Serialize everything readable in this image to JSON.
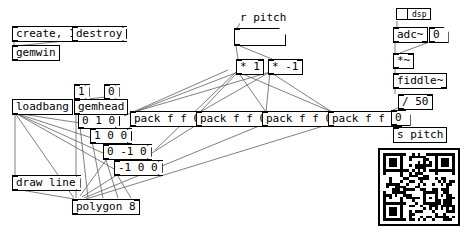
{
  "app": {
    "title": "Pure Data patch canvas",
    "background_color": "#ffffff",
    "wire_color": "#606060",
    "text_color": "#000000"
  },
  "patch": {
    "messages": [
      {
        "id": "msg-create",
        "label": "create, 1",
        "x": 12,
        "y": 26
      },
      {
        "id": "msg-destroy",
        "label": "destroy",
        "x": 72,
        "y": 26
      },
      {
        "id": "msg-one",
        "label": "1",
        "x": 74,
        "y": 84
      },
      {
        "id": "msg-zero",
        "label": "0",
        "x": 104,
        "y": 84
      },
      {
        "id": "msg-vert-0-1-0",
        "label": "0 1 0",
        "x": 78,
        "y": 113
      },
      {
        "id": "msg-vert-1-0-0",
        "label": "1 0 0",
        "x": 90,
        "y": 128
      },
      {
        "id": "msg-vert-0-m1-0",
        "label": "0 -1 0",
        "x": 103,
        "y": 144
      },
      {
        "id": "msg-vert-m1-0-0",
        "label": "-1 0 0",
        "x": 114,
        "y": 160
      },
      {
        "id": "msg-draw-line",
        "label": "draw line",
        "x": 12,
        "y": 175
      }
    ],
    "objects": [
      {
        "id": "obj-gemwin",
        "label": "gemwin",
        "x": 12,
        "y": 45
      },
      {
        "id": "obj-loadbang",
        "label": "loadbang",
        "x": 12,
        "y": 99
      },
      {
        "id": "obj-gemhead",
        "label": "gemhead",
        "x": 74,
        "y": 99
      },
      {
        "id": "obj-polygon",
        "label": "polygon 8",
        "x": 72,
        "y": 199
      },
      {
        "id": "obj-pack-1",
        "label": "pack f f 0",
        "x": 130,
        "y": 111
      },
      {
        "id": "obj-pack-2",
        "label": "pack f f 0",
        "x": 196,
        "y": 111
      },
      {
        "id": "obj-pack-3",
        "label": "pack f f 0",
        "x": 262,
        "y": 111
      },
      {
        "id": "obj-pack-4",
        "label": "pack f f 0",
        "x": 328,
        "y": 111
      },
      {
        "id": "obj-mult-1",
        "label": "* 1",
        "x": 236,
        "y": 59
      },
      {
        "id": "obj-mult-m1",
        "label": "* -1",
        "x": 268,
        "y": 59
      },
      {
        "id": "obj-adc",
        "label": "adc~",
        "x": 393,
        "y": 27
      },
      {
        "id": "obj-mult-sig",
        "label": "*~",
        "x": 393,
        "y": 53
      },
      {
        "id": "obj-fiddle",
        "label": "fiddle~",
        "x": 393,
        "y": 73
      },
      {
        "id": "obj-div-50",
        "label": "/ 50",
        "x": 398,
        "y": 94
      },
      {
        "id": "obj-send-pitch",
        "label": "s pitch",
        "x": 393,
        "y": 127
      }
    ],
    "comments": [
      {
        "id": "cmt-r-pitch",
        "label": "r pitch",
        "x": 240,
        "y": 12
      }
    ],
    "number_boxes": [
      {
        "id": "num-pitch-display",
        "value": "",
        "x": 234,
        "y": 28,
        "wide": true
      },
      {
        "id": "num-adc-gain",
        "value": "0",
        "x": 429,
        "y": 27,
        "wide": false
      },
      {
        "id": "num-pitch-out",
        "value": "0",
        "x": 391,
        "y": 110,
        "wide": false
      }
    ],
    "toggles": [
      {
        "id": "toggle-dsp",
        "label": "dsp",
        "checked": false,
        "x": 396,
        "y": 8
      }
    ],
    "qr_code": {
      "id": "qr-code-image",
      "x": 378,
      "y": 148,
      "size": 82,
      "modules": 25
    }
  }
}
